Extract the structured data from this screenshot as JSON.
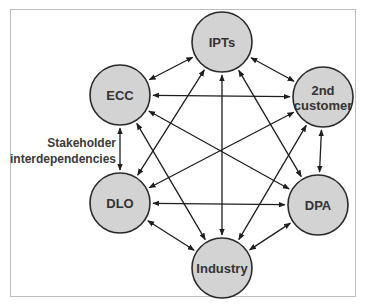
{
  "diagram": {
    "type": "stakeholder-network",
    "side_label": {
      "line1": "Stakeholder",
      "line2": "interdependencies"
    },
    "colors": {
      "node_fill": "#d3d3d3",
      "node_stroke": "#2a2a2a",
      "edge": "#1e1e1e",
      "frame": "#bdbdbd",
      "text": "#333333"
    },
    "nodes": [
      {
        "id": "ipts",
        "label_lines": [
          "IPTs"
        ],
        "cx": 222,
        "cy": 42
      },
      {
        "id": "ecc",
        "label_lines": [
          "ECC"
        ],
        "cx": 120,
        "cy": 95
      },
      {
        "id": "second",
        "label_lines": [
          "2nd",
          "customer"
        ],
        "cx": 323,
        "cy": 97
      },
      {
        "id": "dlo",
        "label_lines": [
          "DLO"
        ],
        "cx": 120,
        "cy": 203
      },
      {
        "id": "dpa",
        "label_lines": [
          "DPA"
        ],
        "cx": 318,
        "cy": 205
      },
      {
        "id": "industry",
        "label_lines": [
          "Industry"
        ],
        "cx": 222,
        "cy": 268
      }
    ],
    "edges": [
      [
        "ipts",
        "ecc"
      ],
      [
        "ipts",
        "second"
      ],
      [
        "ipts",
        "dlo"
      ],
      [
        "ipts",
        "dpa"
      ],
      [
        "ipts",
        "industry"
      ],
      [
        "ecc",
        "second"
      ],
      [
        "ecc",
        "dlo"
      ],
      [
        "ecc",
        "dpa"
      ],
      [
        "ecc",
        "industry"
      ],
      [
        "second",
        "dlo"
      ],
      [
        "second",
        "dpa"
      ],
      [
        "second",
        "industry"
      ],
      [
        "dlo",
        "dpa"
      ],
      [
        "dlo",
        "industry"
      ],
      [
        "dpa",
        "industry"
      ]
    ],
    "edge_style": "bidirectional-arrow",
    "node_radius": 30
  }
}
